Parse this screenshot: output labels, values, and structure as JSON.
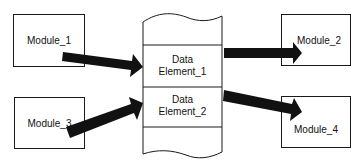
{
  "diagram": {
    "modules": [
      {
        "id": "module_1",
        "label": "Module_1"
      },
      {
        "id": "module_2",
        "label": "Module_2"
      },
      {
        "id": "module_3",
        "label": "Module_3"
      },
      {
        "id": "module_4",
        "label": "Module_4"
      }
    ],
    "data_store": {
      "elements": [
        {
          "id": "data_element_1",
          "line1": "Data",
          "line2": "Element_1"
        },
        {
          "id": "data_element_2",
          "line1": "Data",
          "line2": "Element_2"
        }
      ]
    },
    "edges": [
      {
        "from": "Module_1",
        "to": "Data Element_1"
      },
      {
        "from": "Module_3",
        "to": "Data Element_2"
      },
      {
        "from": "Data Element_1",
        "to": "Module_2"
      },
      {
        "from": "Data Element_2",
        "to": "Module_4"
      }
    ],
    "colors": {
      "stroke": "#1a1a1a",
      "arrow_fill": "#111111",
      "background": "#ffffff"
    }
  }
}
